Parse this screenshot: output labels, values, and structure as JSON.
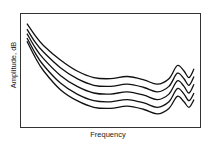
{
  "chart_data": {
    "type": "line",
    "title": "",
    "xlabel": "Frequency",
    "ylabel": "Amplitude, dB",
    "grid": false,
    "legend": "none",
    "x_ticks": [],
    "y_ticks": [],
    "x_range": [
      0,
      1
    ],
    "y_range": [
      0,
      1
    ],
    "x": [
      0.0,
      0.05,
      0.1,
      0.2,
      0.3,
      0.4,
      0.5,
      0.6,
      0.7,
      0.78,
      0.85,
      0.9,
      0.94,
      0.97,
      1.0
    ],
    "series": [
      {
        "name": "curve-1",
        "values": [
          0.93,
          0.82,
          0.73,
          0.6,
          0.5,
          0.44,
          0.43,
          0.45,
          0.42,
          0.38,
          0.43,
          0.55,
          0.5,
          0.44,
          0.52
        ]
      },
      {
        "name": "curve-2",
        "values": [
          0.88,
          0.76,
          0.67,
          0.53,
          0.43,
          0.37,
          0.36,
          0.38,
          0.35,
          0.31,
          0.36,
          0.48,
          0.43,
          0.37,
          0.45
        ]
      },
      {
        "name": "curve-3",
        "values": [
          0.84,
          0.71,
          0.61,
          0.46,
          0.36,
          0.3,
          0.29,
          0.31,
          0.28,
          0.24,
          0.29,
          0.41,
          0.36,
          0.3,
          0.38
        ]
      },
      {
        "name": "curve-4",
        "values": [
          0.8,
          0.66,
          0.55,
          0.39,
          0.29,
          0.23,
          0.22,
          0.24,
          0.21,
          0.17,
          0.22,
          0.34,
          0.29,
          0.23,
          0.3
        ]
      },
      {
        "name": "curve-5",
        "values": [
          0.77,
          0.62,
          0.5,
          0.33,
          0.23,
          0.17,
          0.16,
          0.18,
          0.15,
          0.11,
          0.16,
          0.27,
          0.22,
          0.17,
          0.24
        ]
      }
    ]
  }
}
